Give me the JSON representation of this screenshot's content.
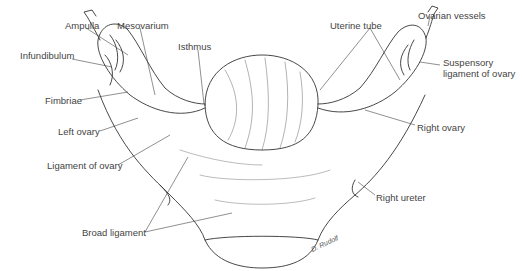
{
  "figure": {
    "signature": "D. Rudolf",
    "labels": {
      "ampulla": "Ampulla",
      "mesovarium": "Mesovarium",
      "infundibulum": "Infundibulum",
      "isthmus": "Isthmus",
      "fimbriae": "Fimbriae",
      "left_ovary": "Left ovary",
      "ligament_of_ovary": "Ligament of ovary",
      "broad_ligament": "Broad ligament",
      "uterine_tube": "Uterine tube",
      "ovarian_vessels": "Ovarian vessels",
      "suspensory_1": "Suspensory",
      "suspensory_2": "ligament of ovary",
      "right_ovary": "Right ovary",
      "right_ureter": "Right ureter"
    }
  }
}
